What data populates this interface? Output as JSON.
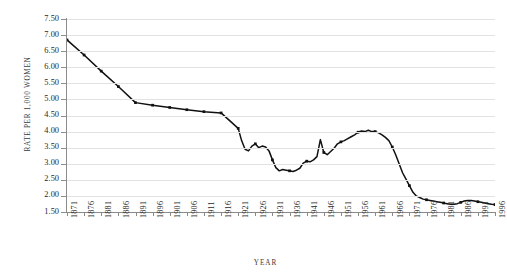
{
  "chart_data": {
    "type": "line",
    "title": "",
    "xlabel": "YEAR",
    "ylabel": "RATE PER 1,000 WOMEN",
    "xlim": [
      1871,
      1996
    ],
    "ylim": [
      1.5,
      7.5
    ],
    "ytick_labels": [
      "7.50",
      "7.00",
      "6.50",
      "6.00",
      "5.50",
      "5.00",
      "4.50",
      "4.00",
      "3.50",
      "3.00",
      "2.50",
      "2.00",
      "1.50"
    ],
    "ytick_values": [
      7.5,
      7.0,
      6.5,
      6.0,
      5.5,
      5.0,
      4.5,
      4.0,
      3.5,
      3.0,
      2.5,
      2.0,
      1.5
    ],
    "xtick_labels": [
      "1871",
      "1876",
      "1881",
      "1886",
      "1891",
      "1896",
      "1901",
      "1906",
      "1911",
      "1916",
      "1921",
      "1926",
      "1931",
      "1936",
      "1941",
      "1946",
      "1951",
      "1956",
      "1961",
      "1966",
      "1971",
      "1976",
      "1981",
      "1986",
      "1991",
      "1996"
    ],
    "xtick_values": [
      1871,
      1876,
      1881,
      1886,
      1891,
      1896,
      1901,
      1906,
      1911,
      1916,
      1921,
      1926,
      1931,
      1936,
      1941,
      1946,
      1951,
      1956,
      1961,
      1966,
      1971,
      1976,
      1981,
      1986,
      1991,
      1996
    ],
    "grid": true,
    "legend": "none",
    "line_color": "#111111",
    "grid_color": "#e2e2e2",
    "axis_color": "#8a8a8a",
    "marker": "square",
    "series": [
      {
        "name": "Divorce rate per 1,000 married women",
        "x": [
          1871,
          1876,
          1881,
          1886,
          1891,
          1896,
          1901,
          1906,
          1911,
          1916,
          1921,
          1922,
          1923,
          1924,
          1925,
          1926,
          1927,
          1928,
          1929,
          1930,
          1931,
          1932,
          1933,
          1934,
          1935,
          1936,
          1937,
          1938,
          1939,
          1940,
          1941,
          1942,
          1943,
          1944,
          1945,
          1946,
          1947,
          1948,
          1949,
          1950,
          1951,
          1952,
          1953,
          1954,
          1955,
          1956,
          1957,
          1958,
          1959,
          1960,
          1961,
          1962,
          1963,
          1964,
          1965,
          1966,
          1967,
          1968,
          1969,
          1970,
          1971,
          1972,
          1973,
          1974,
          1975,
          1976,
          1977,
          1978,
          1979,
          1980,
          1981,
          1982,
          1983,
          1984,
          1985,
          1986,
          1987,
          1988,
          1989,
          1990,
          1991,
          1992,
          1993,
          1994,
          1995,
          1996
        ],
        "y": [
          6.85,
          6.38,
          5.88,
          5.4,
          4.9,
          4.82,
          4.75,
          4.68,
          4.62,
          4.58,
          4.1,
          3.72,
          3.45,
          3.4,
          3.55,
          3.62,
          3.5,
          3.55,
          3.52,
          3.4,
          3.12,
          2.88,
          2.78,
          2.82,
          2.8,
          2.78,
          2.76,
          2.8,
          2.86,
          3.02,
          3.08,
          3.06,
          3.12,
          3.22,
          3.75,
          3.35,
          3.28,
          3.38,
          3.48,
          3.62,
          3.68,
          3.72,
          3.78,
          3.84,
          3.9,
          3.98,
          4.02,
          4.0,
          4.04,
          4.0,
          4.0,
          3.96,
          3.9,
          3.82,
          3.72,
          3.52,
          3.28,
          3.0,
          2.72,
          2.52,
          2.32,
          2.12,
          2.0,
          1.95,
          1.9,
          1.88,
          1.86,
          1.84,
          1.82,
          1.8,
          1.78,
          1.76,
          1.74,
          1.74,
          1.76,
          1.8,
          1.84,
          1.86,
          1.86,
          1.84,
          1.82,
          1.8,
          1.78,
          1.76,
          1.74,
          1.73
        ]
      }
    ]
  }
}
